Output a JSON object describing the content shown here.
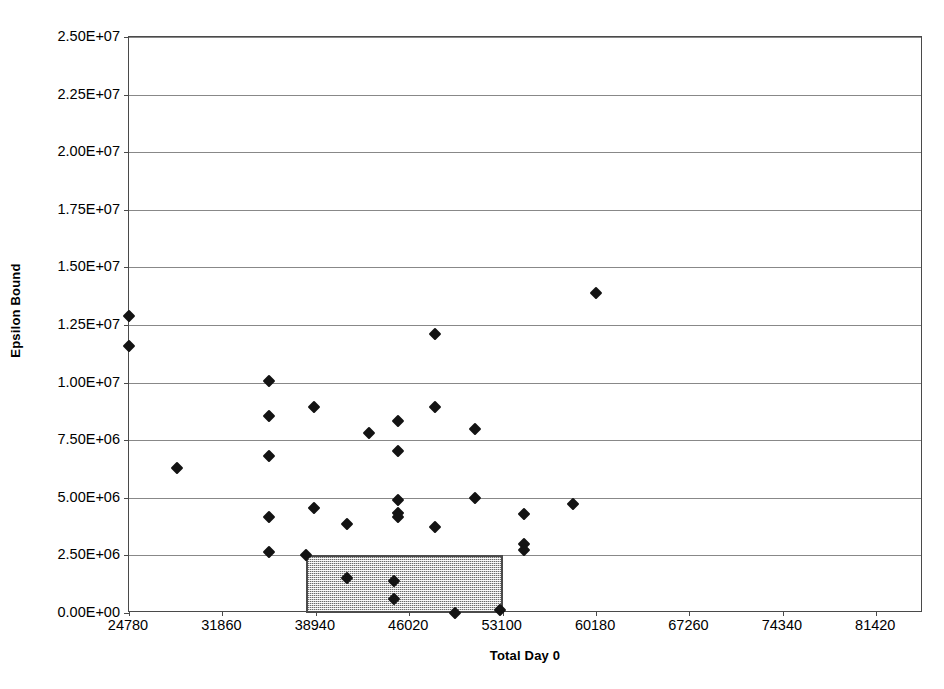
{
  "chart_data": {
    "type": "scatter",
    "title": "",
    "xlabel": "Total Day 0",
    "ylabel": "Epsilon Bound",
    "xlim": [
      24780,
      84960
    ],
    "ylim": [
      0,
      25000000
    ],
    "grid": true,
    "legend": false,
    "x_ticks": [
      24780,
      31860,
      38940,
      46020,
      53100,
      60180,
      67260,
      74340,
      81420
    ],
    "x_tick_labels": [
      "24780",
      "31860",
      "38940",
      "46020",
      "53100",
      "60180",
      "67260",
      "74340",
      "81420"
    ],
    "y_ticks": [
      0,
      2500000,
      5000000,
      7500000,
      10000000,
      12500000,
      15000000,
      17500000,
      20000000,
      22500000,
      25000000
    ],
    "y_tick_labels": [
      "0.00E+00",
      "2.50E+06",
      "5.00E+06",
      "7.50E+06",
      "1.00E+07",
      "1.25E+07",
      "1.50E+07",
      "1.75E+07",
      "2.00E+07",
      "2.25E+07",
      "2.50E+07"
    ],
    "marker": "diamond",
    "marker_color": "#131313",
    "points": [
      {
        "x": 24780,
        "y": 12900000
      },
      {
        "x": 24780,
        "y": 11600000
      },
      {
        "x": 28400,
        "y": 6300000
      },
      {
        "x": 35400,
        "y": 10050000
      },
      {
        "x": 35400,
        "y": 8550000
      },
      {
        "x": 35400,
        "y": 6800000
      },
      {
        "x": 35400,
        "y": 4150000
      },
      {
        "x": 35400,
        "y": 2650000
      },
      {
        "x": 38800,
        "y": 8950000
      },
      {
        "x": 38800,
        "y": 4550000
      },
      {
        "x": 41300,
        "y": 3850000
      },
      {
        "x": 43000,
        "y": 7800000
      },
      {
        "x": 45200,
        "y": 8350000
      },
      {
        "x": 45200,
        "y": 7050000
      },
      {
        "x": 45200,
        "y": 4900000
      },
      {
        "x": 45200,
        "y": 4350000
      },
      {
        "x": 45200,
        "y": 4150000
      },
      {
        "x": 48000,
        "y": 12100000
      },
      {
        "x": 48000,
        "y": 8950000
      },
      {
        "x": 48000,
        "y": 3750000
      },
      {
        "x": 51000,
        "y": 8000000
      },
      {
        "x": 51000,
        "y": 5000000
      },
      {
        "x": 54700,
        "y": 4300000
      },
      {
        "x": 54700,
        "y": 3000000
      },
      {
        "x": 54700,
        "y": 2750000
      },
      {
        "x": 58400,
        "y": 4750000
      },
      {
        "x": 60180,
        "y": 13900000
      },
      {
        "x": 38200,
        "y": 2500000
      },
      {
        "x": 41300,
        "y": 1500000
      },
      {
        "x": 44900,
        "y": 1400000
      },
      {
        "x": 44900,
        "y": 600000
      },
      {
        "x": 49500,
        "y": 0
      },
      {
        "x": 52900,
        "y": 150000
      }
    ],
    "highlight_region": {
      "name": "shaded-box",
      "x0": 38200,
      "x1": 53100,
      "y0": 0,
      "y1": 2500000,
      "fill_color": "#c9c9c9",
      "border_color": "#4b4b4b",
      "pattern": "stipple"
    }
  }
}
